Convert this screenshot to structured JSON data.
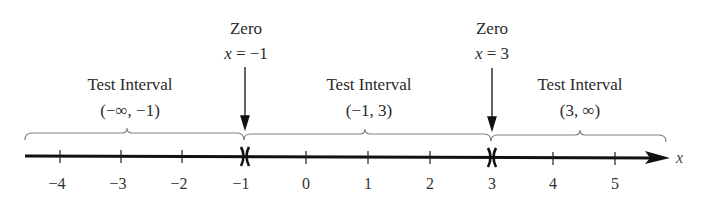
{
  "diagram": {
    "type": "number-line-test-intervals",
    "axis_variable": "x",
    "ticks": [
      "−4",
      "−3",
      "−2",
      "−1",
      "0",
      "1",
      "2",
      "3",
      "4",
      "5"
    ],
    "zeros": [
      {
        "title": "Zero",
        "equation_var": "x",
        "equation_rest": " = −1",
        "value": -1
      },
      {
        "title": "Zero",
        "equation_var": "x",
        "equation_rest": " = 3",
        "value": 3
      }
    ],
    "intervals": [
      {
        "title": "Test Interval",
        "notation": "(−∞, −1)"
      },
      {
        "title": "Test Interval",
        "notation": "(−1, 3)"
      },
      {
        "title": "Test Interval",
        "notation": "(3, ∞)"
      }
    ],
    "colors": {
      "line": "#111111",
      "brace": "#777777",
      "text": "#2a2a2a"
    }
  }
}
